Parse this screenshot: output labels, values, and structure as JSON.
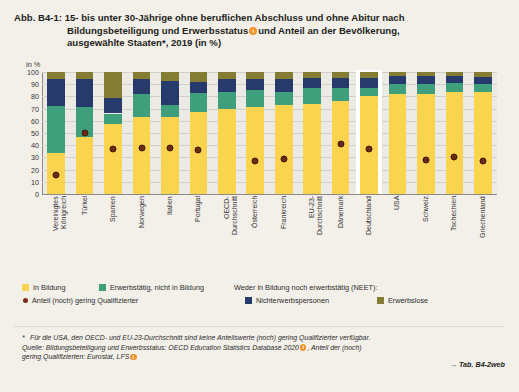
{
  "figure": {
    "number": "Abb. B4-1:",
    "title_line1": "15- bis unter 30-Jährige ohne beruflichen Abschluss und ohne Abitur nach",
    "title_line2_a": "Bildungsbeteiligung und Erwerbsstatus",
    "title_line2_b": "und Anteil an der Bevölkerung,",
    "title_line3": "ausgewählte Staaten*, 2019 (in %)",
    "marker_glyph": "i"
  },
  "axis": {
    "unit_label": "in %",
    "yticks": [
      "100",
      "90",
      "80",
      "70",
      "60",
      "50",
      "40",
      "30",
      "20",
      "10",
      "0"
    ],
    "ymin": 0,
    "ymax": 100
  },
  "legend": {
    "items": [
      {
        "label": "In Bildung",
        "color": "#fbd44f",
        "type": "swatch"
      },
      {
        "label": "Erwerbstätig, nicht in Bildung",
        "color": "#3f9e7c",
        "type": "swatch"
      },
      {
        "label": "Anteil (noch) gering Qualifizierter",
        "color": "#7a2d12",
        "type": "dot"
      },
      {
        "label": "Weder in Bildung noch erwerbstätig (NEET):",
        "color": "",
        "type": "header"
      },
      {
        "label": "Nichterwerbspersonen",
        "color": "#263a6b",
        "type": "swatch"
      },
      {
        "label": "Erwerbslose",
        "color": "#857c33",
        "type": "swatch"
      }
    ]
  },
  "notes": {
    "star": "*",
    "line1": "Für die USA, den OECD- und EU-23-Durchschnitt sind keine Anteilswerte (noch) gering Qualifizierter verfügbar.",
    "line2_a": "Quelle: Bildungsbeteiligung und Erwerbsstatus: OECD Education Statistics Database 2020",
    "line2_b": ", Anteil der (noch)",
    "line3_a": "gering Qualifizierten: Eurostat, LFS",
    "tab_ref": "→ Tab. B4-2web"
  },
  "chart_data": {
    "type": "bar",
    "subtype": "stacked-bar-with-overlay-points",
    "xlabel": "",
    "ylabel": "in %",
    "ylim": [
      0,
      100
    ],
    "ytick_step": 10,
    "grid": true,
    "legend_position": "bottom",
    "highlight_category": "Deutschland",
    "categories": [
      "Vereinigtes Königreich",
      "Türkei",
      "Spanien",
      "Norwegen",
      "Italien",
      "Portugal",
      "OECD-Durchschnitt",
      "Österreich",
      "Frankreich",
      "EU-23-Durchschnitt",
      "Dänemark",
      "Deutschland",
      "USA",
      "Schweiz",
      "Tschechien",
      "Griechenland"
    ],
    "series": [
      {
        "name": "In Bildung",
        "color": "#fbd44f",
        "values": [
          34,
          47,
          57,
          63,
          63,
          67,
          70,
          71,
          73,
          74,
          76,
          80,
          82,
          82,
          84,
          84
        ]
      },
      {
        "name": "Erwerbstätig, nicht in Bildung",
        "color": "#3f9e7c",
        "values": [
          38,
          24,
          9,
          19,
          10,
          16,
          14,
          14,
          11,
          13,
          11,
          7,
          8,
          8,
          7,
          6
        ]
      },
      {
        "name": "Nichterwerbspersonen",
        "color": "#263a6b",
        "values": [
          22,
          23,
          13,
          12,
          20,
          9,
          10,
          9,
          10,
          8,
          8,
          8,
          7,
          7,
          6,
          6
        ]
      },
      {
        "name": "Erwerbslose",
        "color": "#857c33",
        "values": [
          6,
          6,
          21,
          6,
          7,
          8,
          6,
          6,
          6,
          5,
          5,
          5,
          3,
          3,
          3,
          4
        ]
      }
    ],
    "overlay_points": {
      "name": "Anteil (noch) gering Qualifizierter",
      "color": "#7a2d12",
      "values": [
        18,
        52,
        39,
        40,
        40,
        38,
        null,
        29,
        31,
        null,
        43,
        39,
        null,
        30,
        32,
        29
      ]
    }
  }
}
